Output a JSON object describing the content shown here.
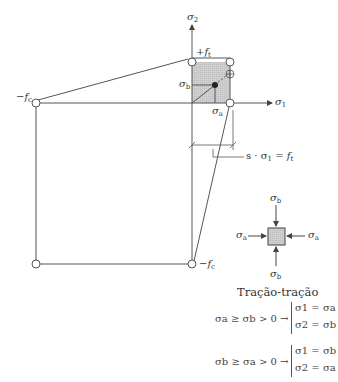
{
  "diagram": {
    "type": "biaxial failure envelope",
    "axes": {
      "x_label": "σ1",
      "y_label": "σ2"
    },
    "labels": {
      "tension_strength": "+f",
      "tension_sub": "t",
      "compression_left": "−f",
      "compression_left_sub": "c",
      "compression_bottom": "−f",
      "compression_bottom_sub": "c",
      "sigma_b": "σ",
      "sigma_b_sub": "b",
      "sigma_a": "σ",
      "sigma_a_sub": "a",
      "sigma_x_axis": "σ",
      "sigma_x_sub": "1",
      "sigma_y_axis": "σ",
      "sigma_y_sub": "2",
      "dimension_note": "s · σ",
      "dimension_note_sub": "1",
      "dimension_note_rhs": " = f",
      "dimension_note_rhs_sub": "t",
      "plus_marker": "⊕"
    },
    "element": {
      "top": "σ",
      "top_sub": "b",
      "bottom": "σ",
      "bottom_sub": "b",
      "left": "σ",
      "left_sub": "a",
      "right": "σ",
      "right_sub": "a"
    },
    "colors": {
      "line": "#555555",
      "fill": "#c8c8c8",
      "point": "#222222"
    }
  },
  "legend": {
    "title": "Tração-tração",
    "rules": [
      {
        "condition": "σa ≥ σb > 0 →",
        "result1": "σ1 = σa",
        "result2": "σ2 = σb"
      },
      {
        "condition": "σb ≥ σa > 0 →",
        "result1": "σ1 = σb",
        "result2": "σ2 = σa"
      }
    ]
  }
}
